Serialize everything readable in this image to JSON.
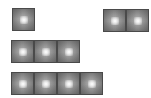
{
  "board": {
    "background": "#ffffff",
    "tile_color": "#a8a8a8",
    "tile_border": "#4a4a4a",
    "pieces": [
      {
        "name": "piece-1",
        "tiles": 1,
        "x": 12,
        "y": 8
      },
      {
        "name": "piece-2",
        "tiles": 2,
        "x": 103,
        "y": 9
      },
      {
        "name": "piece-3",
        "tiles": 3,
        "x": 11,
        "y": 40
      },
      {
        "name": "piece-4",
        "tiles": 4,
        "x": 11,
        "y": 72
      }
    ]
  }
}
